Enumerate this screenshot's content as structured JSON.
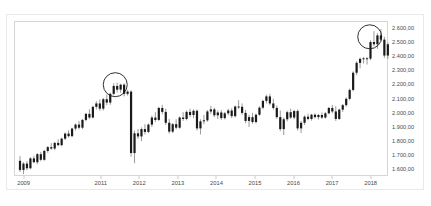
{
  "chart_data": {
    "type": "bar",
    "chart_style": "candlestick",
    "title": "",
    "subtitle": "",
    "xlabel": "",
    "ylabel": "",
    "grid": false,
    "legend": null,
    "legend_position": "none",
    "background_color": "#ffffff",
    "candle_color": "#1a1a1a",
    "wick_color": "#6e6e6e",
    "border_color": "#d6d6d6",
    "annotation_color": "#1a1a1a",
    "ylim": [
      1550,
      2650
    ],
    "xlim": [
      2008.75,
      2018.45
    ],
    "y_ticks": [
      2600,
      2500,
      2400,
      2300,
      2200,
      2100,
      2000,
      1900,
      1800,
      1700,
      1600
    ],
    "y_tick_labels": [
      "2.600,00",
      "2.500,00",
      "2.400,00",
      "2.300,00",
      "2.200,00",
      "2.100,00",
      "2.000,00",
      "1.900,00",
      "1.800,00",
      "1.700,00",
      "1.600,00"
    ],
    "x_ticks": [
      2009,
      2011,
      2012,
      2013,
      2014,
      2015,
      2016,
      2017,
      2018
    ],
    "x_tick_labels": [
      "2009",
      "2011",
      "2012",
      "2013",
      "2014",
      "2015",
      "2016",
      "2017",
      "2018"
    ],
    "annotations": [
      {
        "type": "circle",
        "label": "peak-2011",
        "x": 2011.35,
        "y": 2205,
        "radius_px": 12
      },
      {
        "type": "circle",
        "label": "peak-2018",
        "x": 2017.95,
        "y": 2545,
        "radius_px": 12
      }
    ],
    "candles": [
      {
        "x": 2008.88,
        "o": 1665,
        "h": 1700,
        "l": 1585,
        "c": 1600
      },
      {
        "x": 2008.97,
        "o": 1600,
        "h": 1655,
        "l": 1570,
        "c": 1645
      },
      {
        "x": 2009.06,
        "o": 1645,
        "h": 1662,
        "l": 1598,
        "c": 1612
      },
      {
        "x": 2009.15,
        "o": 1612,
        "h": 1690,
        "l": 1605,
        "c": 1682
      },
      {
        "x": 2009.24,
        "o": 1682,
        "h": 1700,
        "l": 1648,
        "c": 1655
      },
      {
        "x": 2009.33,
        "o": 1655,
        "h": 1720,
        "l": 1640,
        "c": 1712
      },
      {
        "x": 2009.42,
        "o": 1712,
        "h": 1728,
        "l": 1662,
        "c": 1672
      },
      {
        "x": 2009.51,
        "o": 1672,
        "h": 1742,
        "l": 1665,
        "c": 1735
      },
      {
        "x": 2009.6,
        "o": 1735,
        "h": 1770,
        "l": 1722,
        "c": 1762
      },
      {
        "x": 2009.69,
        "o": 1762,
        "h": 1790,
        "l": 1742,
        "c": 1752
      },
      {
        "x": 2009.78,
        "o": 1752,
        "h": 1800,
        "l": 1740,
        "c": 1792
      },
      {
        "x": 2009.87,
        "o": 1792,
        "h": 1818,
        "l": 1768,
        "c": 1776
      },
      {
        "x": 2009.96,
        "o": 1776,
        "h": 1830,
        "l": 1768,
        "c": 1822
      },
      {
        "x": 2010.05,
        "o": 1822,
        "h": 1866,
        "l": 1812,
        "c": 1858
      },
      {
        "x": 2010.14,
        "o": 1858,
        "h": 1882,
        "l": 1830,
        "c": 1840
      },
      {
        "x": 2010.23,
        "o": 1840,
        "h": 1900,
        "l": 1832,
        "c": 1894
      },
      {
        "x": 2010.32,
        "o": 1894,
        "h": 1930,
        "l": 1880,
        "c": 1922
      },
      {
        "x": 2010.41,
        "o": 1922,
        "h": 1948,
        "l": 1888,
        "c": 1900
      },
      {
        "x": 2010.5,
        "o": 1900,
        "h": 1962,
        "l": 1890,
        "c": 1955
      },
      {
        "x": 2010.59,
        "o": 1955,
        "h": 2005,
        "l": 1945,
        "c": 1998
      },
      {
        "x": 2010.68,
        "o": 1998,
        "h": 2030,
        "l": 1960,
        "c": 1972
      },
      {
        "x": 2010.77,
        "o": 1972,
        "h": 2055,
        "l": 1965,
        "c": 2048
      },
      {
        "x": 2010.86,
        "o": 2048,
        "h": 2088,
        "l": 2030,
        "c": 2072
      },
      {
        "x": 2010.95,
        "o": 2072,
        "h": 2100,
        "l": 2020,
        "c": 2035
      },
      {
        "x": 2011.04,
        "o": 2035,
        "h": 2112,
        "l": 2022,
        "c": 2102
      },
      {
        "x": 2011.13,
        "o": 2102,
        "h": 2135,
        "l": 2060,
        "c": 2078
      },
      {
        "x": 2011.22,
        "o": 2078,
        "h": 2148,
        "l": 2062,
        "c": 2140
      },
      {
        "x": 2011.31,
        "o": 2140,
        "h": 2215,
        "l": 2132,
        "c": 2196
      },
      {
        "x": 2011.4,
        "o": 2196,
        "h": 2220,
        "l": 2150,
        "c": 2170
      },
      {
        "x": 2011.49,
        "o": 2170,
        "h": 2212,
        "l": 2148,
        "c": 2205
      },
      {
        "x": 2011.58,
        "o": 2205,
        "h": 2215,
        "l": 2122,
        "c": 2140
      },
      {
        "x": 2011.67,
        "o": 2140,
        "h": 2168,
        "l": 2128,
        "c": 2156
      },
      {
        "x": 2011.76,
        "o": 2156,
        "h": 2165,
        "l": 1695,
        "c": 1720
      },
      {
        "x": 2011.85,
        "o": 1720,
        "h": 1880,
        "l": 1648,
        "c": 1860
      },
      {
        "x": 2011.94,
        "o": 1860,
        "h": 1890,
        "l": 1820,
        "c": 1838
      },
      {
        "x": 2012.03,
        "o": 1838,
        "h": 1902,
        "l": 1805,
        "c": 1890
      },
      {
        "x": 2012.12,
        "o": 1890,
        "h": 1925,
        "l": 1852,
        "c": 1870
      },
      {
        "x": 2012.21,
        "o": 1870,
        "h": 1930,
        "l": 1862,
        "c": 1922
      },
      {
        "x": 2012.3,
        "o": 1922,
        "h": 1985,
        "l": 1905,
        "c": 1972
      },
      {
        "x": 2012.39,
        "o": 1972,
        "h": 2010,
        "l": 1940,
        "c": 1955
      },
      {
        "x": 2012.48,
        "o": 1955,
        "h": 2048,
        "l": 1948,
        "c": 2040
      },
      {
        "x": 2012.57,
        "o": 2040,
        "h": 2062,
        "l": 1995,
        "c": 2012
      },
      {
        "x": 2012.66,
        "o": 2012,
        "h": 2035,
        "l": 1920,
        "c": 1935
      },
      {
        "x": 2012.75,
        "o": 1935,
        "h": 1962,
        "l": 1858,
        "c": 1872
      },
      {
        "x": 2012.84,
        "o": 1872,
        "h": 1932,
        "l": 1862,
        "c": 1925
      },
      {
        "x": 2012.93,
        "o": 1925,
        "h": 1960,
        "l": 1888,
        "c": 1900
      },
      {
        "x": 2013.02,
        "o": 1900,
        "h": 1980,
        "l": 1892,
        "c": 1972
      },
      {
        "x": 2013.11,
        "o": 1972,
        "h": 2010,
        "l": 1948,
        "c": 1962
      },
      {
        "x": 2013.2,
        "o": 1962,
        "h": 2022,
        "l": 1952,
        "c": 2012
      },
      {
        "x": 2013.29,
        "o": 2012,
        "h": 2035,
        "l": 1975,
        "c": 1990
      },
      {
        "x": 2013.38,
        "o": 1990,
        "h": 2030,
        "l": 1968,
        "c": 2020
      },
      {
        "x": 2013.47,
        "o": 2020,
        "h": 2030,
        "l": 1880,
        "c": 1895
      },
      {
        "x": 2013.56,
        "o": 1895,
        "h": 1960,
        "l": 1852,
        "c": 1945
      },
      {
        "x": 2013.65,
        "o": 1945,
        "h": 1990,
        "l": 1925,
        "c": 1952
      },
      {
        "x": 2013.74,
        "o": 1952,
        "h": 2025,
        "l": 1942,
        "c": 2015
      },
      {
        "x": 2013.83,
        "o": 2015,
        "h": 2055,
        "l": 1998,
        "c": 2030
      },
      {
        "x": 2013.92,
        "o": 2030,
        "h": 2042,
        "l": 1975,
        "c": 1988
      },
      {
        "x": 2014.01,
        "o": 1988,
        "h": 2022,
        "l": 1962,
        "c": 2008
      },
      {
        "x": 2014.1,
        "o": 2008,
        "h": 2025,
        "l": 1955,
        "c": 1968
      },
      {
        "x": 2014.19,
        "o": 1968,
        "h": 2012,
        "l": 1958,
        "c": 2002
      },
      {
        "x": 2014.28,
        "o": 2002,
        "h": 2035,
        "l": 1988,
        "c": 2022
      },
      {
        "x": 2014.37,
        "o": 2022,
        "h": 2038,
        "l": 1968,
        "c": 1982
      },
      {
        "x": 2014.46,
        "o": 1982,
        "h": 2058,
        "l": 1972,
        "c": 2050
      },
      {
        "x": 2014.55,
        "o": 2050,
        "h": 2095,
        "l": 2032,
        "c": 2048
      },
      {
        "x": 2014.64,
        "o": 2048,
        "h": 2072,
        "l": 1992,
        "c": 2005
      },
      {
        "x": 2014.73,
        "o": 2005,
        "h": 2025,
        "l": 1932,
        "c": 1948
      },
      {
        "x": 2014.82,
        "o": 1948,
        "h": 1992,
        "l": 1905,
        "c": 1975
      },
      {
        "x": 2014.91,
        "o": 1975,
        "h": 2005,
        "l": 1928,
        "c": 1940
      },
      {
        "x": 2015.0,
        "o": 1940,
        "h": 2000,
        "l": 1930,
        "c": 1992
      },
      {
        "x": 2015.09,
        "o": 1992,
        "h": 2052,
        "l": 1985,
        "c": 2042
      },
      {
        "x": 2015.18,
        "o": 2042,
        "h": 2098,
        "l": 2030,
        "c": 2090
      },
      {
        "x": 2015.27,
        "o": 2090,
        "h": 2135,
        "l": 2072,
        "c": 2122
      },
      {
        "x": 2015.36,
        "o": 2122,
        "h": 2140,
        "l": 2060,
        "c": 2072
      },
      {
        "x": 2015.45,
        "o": 2072,
        "h": 2105,
        "l": 2028,
        "c": 2040
      },
      {
        "x": 2015.54,
        "o": 2040,
        "h": 2058,
        "l": 1962,
        "c": 1975
      },
      {
        "x": 2015.63,
        "o": 1975,
        "h": 2022,
        "l": 1875,
        "c": 1890
      },
      {
        "x": 2015.72,
        "o": 1890,
        "h": 1972,
        "l": 1848,
        "c": 1960
      },
      {
        "x": 2015.81,
        "o": 1960,
        "h": 2020,
        "l": 1945,
        "c": 2010
      },
      {
        "x": 2015.9,
        "o": 2010,
        "h": 2035,
        "l": 1962,
        "c": 1972
      },
      {
        "x": 2015.99,
        "o": 1972,
        "h": 2028,
        "l": 1960,
        "c": 2018
      },
      {
        "x": 2016.08,
        "o": 2018,
        "h": 2030,
        "l": 1880,
        "c": 1895
      },
      {
        "x": 2016.17,
        "o": 1895,
        "h": 1948,
        "l": 1862,
        "c": 1935
      },
      {
        "x": 2016.26,
        "o": 1935,
        "h": 1988,
        "l": 1920,
        "c": 1978
      },
      {
        "x": 2016.35,
        "o": 1978,
        "h": 2000,
        "l": 1952,
        "c": 1962
      },
      {
        "x": 2016.44,
        "o": 1962,
        "h": 1998,
        "l": 1950,
        "c": 1992
      },
      {
        "x": 2016.53,
        "o": 1992,
        "h": 2002,
        "l": 1965,
        "c": 1975
      },
      {
        "x": 2016.62,
        "o": 1975,
        "h": 1998,
        "l": 1958,
        "c": 1990
      },
      {
        "x": 2016.71,
        "o": 1990,
        "h": 2008,
        "l": 1962,
        "c": 1972
      },
      {
        "x": 2016.8,
        "o": 1972,
        "h": 2010,
        "l": 1965,
        "c": 2002
      },
      {
        "x": 2016.89,
        "o": 2002,
        "h": 2048,
        "l": 1995,
        "c": 2040
      },
      {
        "x": 2016.98,
        "o": 2040,
        "h": 2062,
        "l": 2002,
        "c": 2015
      },
      {
        "x": 2017.07,
        "o": 2015,
        "h": 2052,
        "l": 1948,
        "c": 1962
      },
      {
        "x": 2017.16,
        "o": 1962,
        "h": 2035,
        "l": 1955,
        "c": 2028
      },
      {
        "x": 2017.25,
        "o": 2028,
        "h": 2068,
        "l": 2012,
        "c": 2060
      },
      {
        "x": 2017.34,
        "o": 2060,
        "h": 2115,
        "l": 2048,
        "c": 2105
      },
      {
        "x": 2017.43,
        "o": 2105,
        "h": 2178,
        "l": 2095,
        "c": 2168
      },
      {
        "x": 2017.52,
        "o": 2168,
        "h": 2300,
        "l": 2158,
        "c": 2290
      },
      {
        "x": 2017.61,
        "o": 2290,
        "h": 2372,
        "l": 2272,
        "c": 2360
      },
      {
        "x": 2017.7,
        "o": 2360,
        "h": 2398,
        "l": 2322,
        "c": 2388
      },
      {
        "x": 2017.79,
        "o": 2388,
        "h": 2402,
        "l": 2355,
        "c": 2392
      },
      {
        "x": 2017.88,
        "o": 2392,
        "h": 2402,
        "l": 2348,
        "c": 2390
      },
      {
        "x": 2017.97,
        "o": 2390,
        "h": 2520,
        "l": 2378,
        "c": 2508
      },
      {
        "x": 2018.06,
        "o": 2508,
        "h": 2585,
        "l": 2478,
        "c": 2492
      },
      {
        "x": 2018.15,
        "o": 2492,
        "h": 2572,
        "l": 2460,
        "c": 2555
      },
      {
        "x": 2018.24,
        "o": 2555,
        "h": 2600,
        "l": 2512,
        "c": 2525
      },
      {
        "x": 2018.33,
        "o": 2525,
        "h": 2545,
        "l": 2395,
        "c": 2412
      },
      {
        "x": 2018.42,
        "o": 2412,
        "h": 2505,
        "l": 2388,
        "c": 2492
      },
      {
        "x": 2018.51,
        "o": 2492,
        "h": 2500,
        "l": 2412,
        "c": 2428
      }
    ]
  }
}
